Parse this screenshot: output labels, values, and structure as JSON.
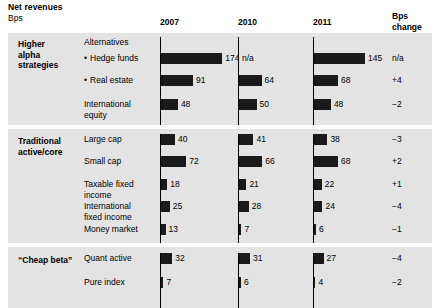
{
  "header": {
    "title": "Net revenues",
    "subtitle": "Bps",
    "columns": [
      {
        "label": "2007",
        "x": 160
      },
      {
        "label": "2010",
        "x": 238
      },
      {
        "label": "2011",
        "x": 313
      }
    ],
    "change_column": {
      "line1": "Bps change",
      "line2": "2010–11",
      "x": 392
    }
  },
  "chart_data": {
    "type": "bar",
    "title": "Net revenues",
    "subtitle": "Bps",
    "xlabel": "",
    "ylabel": "Bps",
    "series": [
      {
        "name": "2007"
      },
      {
        "name": "2010"
      },
      {
        "name": "2011"
      }
    ],
    "change_series": "Bps change 2010–11",
    "scale_px_per_bps": 0.352,
    "groups": [
      {
        "label": "Higher\nalpha\nstrategies",
        "rows": [
          {
            "label": "Alternatives",
            "header_only": true,
            "bullet": false
          },
          {
            "label": "Hedge funds",
            "bullet": true,
            "v2007": 174,
            "v2010": null,
            "v2011": 145,
            "d2007": "174",
            "d2010": "n/a",
            "d2011": "145",
            "change": "n/a"
          },
          {
            "label": "Real estate",
            "bullet": true,
            "v2007": 91,
            "v2010": 64,
            "v2011": 68,
            "d2007": "91",
            "d2010": "64",
            "d2011": "68",
            "change": "+4"
          },
          {
            "label": "International\nequity",
            "bullet": false,
            "v2007": 48,
            "v2010": 50,
            "v2011": 48,
            "d2007": "48",
            "d2010": "50",
            "d2011": "48",
            "change": "−2"
          }
        ]
      },
      {
        "label": "Traditional\nactive/core",
        "rows": [
          {
            "label": "Large cap",
            "bullet": false,
            "v2007": 40,
            "v2010": 41,
            "v2011": 38,
            "d2007": "40",
            "d2010": "41",
            "d2011": "38",
            "change": "−3"
          },
          {
            "label": "Small cap",
            "bullet": false,
            "v2007": 72,
            "v2010": 66,
            "v2011": 68,
            "d2007": "72",
            "d2010": "66",
            "d2011": "68",
            "change": "+2"
          },
          {
            "label": "Taxable fixed\nincome",
            "bullet": false,
            "v2007": 18,
            "v2010": 21,
            "v2011": 22,
            "d2007": "18",
            "d2010": "21",
            "d2011": "22",
            "change": "+1"
          },
          {
            "label": "International\nfixed income",
            "bullet": false,
            "v2007": 25,
            "v2010": 28,
            "v2011": 24,
            "d2007": "25",
            "d2010": "28",
            "d2011": "24",
            "change": "−4"
          },
          {
            "label": "Money market",
            "bullet": false,
            "v2007": 13,
            "v2010": 7,
            "v2011": 6,
            "d2007": "13",
            "d2010": "7",
            "d2011": "6",
            "change": "−1"
          }
        ]
      },
      {
        "label": "“Cheap beta”",
        "rows": [
          {
            "label": "Quant active",
            "bullet": false,
            "v2007": 32,
            "v2010": 31,
            "v2011": 27,
            "d2007": "32",
            "d2010": "31",
            "d2011": "27",
            "change": "−4"
          },
          {
            "label": "Pure index",
            "bullet": false,
            "v2007": 7,
            "v2010": 6,
            "v2011": 4,
            "d2007": "7",
            "d2010": "6",
            "d2011": "4",
            "change": "−2"
          }
        ]
      }
    ]
  },
  "colors": {
    "panel": "#e3e3e3",
    "bar": "#1a1a1a",
    "separator": "#ffffff",
    "text": "#000000"
  }
}
